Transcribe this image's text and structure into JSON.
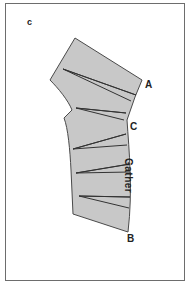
{
  "figure": {
    "label": "c",
    "points": {
      "a": "A",
      "b": "B",
      "c": "C"
    },
    "annotation": "Gather",
    "colors": {
      "fill": "#c8c8c8",
      "stroke": "#4a4a4a",
      "frame": "#6d6d6d"
    }
  }
}
